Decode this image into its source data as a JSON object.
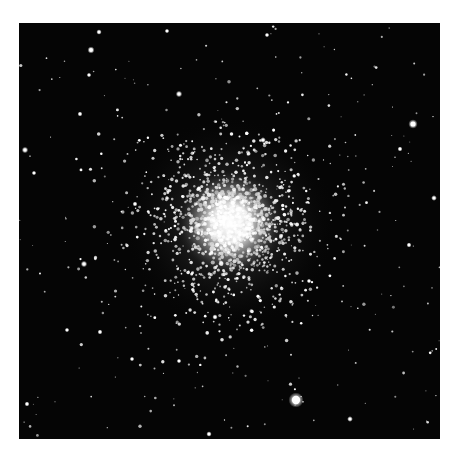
{
  "image": {
    "subject": "Globular star cluster on black sky",
    "background_color": "#050505",
    "page_color": "#ffffff",
    "core": {
      "cx": 211,
      "cy": 200,
      "r": 34
    },
    "bright_stars": [
      {
        "x": 277,
        "y": 377,
        "r": 4.2
      },
      {
        "x": 394,
        "y": 101,
        "r": 2.6
      },
      {
        "x": 72,
        "y": 27,
        "r": 2.0
      },
      {
        "x": 160,
        "y": 71,
        "r": 1.8
      },
      {
        "x": 6,
        "y": 127,
        "r": 1.8
      },
      {
        "x": 65,
        "y": 241,
        "r": 1.8
      },
      {
        "x": 415,
        "y": 175,
        "r": 1.6
      },
      {
        "x": 80,
        "y": 9,
        "r": 1.5
      },
      {
        "x": 381,
        "y": 126,
        "r": 1.4
      },
      {
        "x": 15,
        "y": 150,
        "r": 1.3
      },
      {
        "x": 81,
        "y": 309,
        "r": 1.4
      },
      {
        "x": 190,
        "y": 411,
        "r": 1.5
      },
      {
        "x": 331,
        "y": 396,
        "r": 1.6
      },
      {
        "x": 8,
        "y": 381,
        "r": 1.4
      },
      {
        "x": 244,
        "y": 117,
        "r": 1.6
      },
      {
        "x": 61,
        "y": 91,
        "r": 1.4
      },
      {
        "x": 148,
        "y": 8,
        "r": 1.3
      },
      {
        "x": 248,
        "y": 12,
        "r": 1.3
      },
      {
        "x": 70,
        "y": 52,
        "r": 1.3
      },
      {
        "x": 390,
        "y": 222,
        "r": 1.4
      },
      {
        "x": 196,
        "y": 294,
        "r": 1.5
      },
      {
        "x": 48,
        "y": 307,
        "r": 1.3
      },
      {
        "x": 113,
        "y": 336,
        "r": 1.3
      },
      {
        "x": 160,
        "y": 338,
        "r": 1.3
      },
      {
        "x": 290,
        "y": 258,
        "r": 1.3
      },
      {
        "x": 116,
        "y": 181,
        "r": 1.4
      }
    ]
  }
}
